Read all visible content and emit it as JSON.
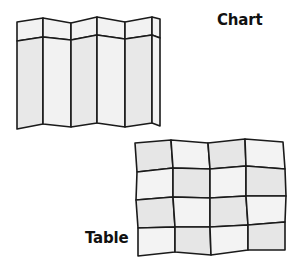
{
  "labels": {
    "chart": "Chart",
    "table": "Table"
  },
  "colors": {
    "stroke": "#1a1a1a",
    "panel_light": "#f2f2f2",
    "panel_mid": "#e8e8e8",
    "background": "#ffffff"
  },
  "folded_chart": {
    "panels": 6,
    "fold_x": [
      17,
      43,
      71,
      97,
      125,
      152,
      160
    ],
    "top_y": [
      22,
      18,
      23,
      17,
      22,
      17,
      19
    ],
    "header_y": [
      41,
      37,
      40,
      35,
      39,
      35,
      38
    ],
    "bottom_y": [
      129,
      124,
      127,
      123,
      127,
      123,
      126
    ]
  },
  "distorted_table": {
    "rows": 4,
    "cols": 4,
    "vertices": [
      [
        [
          135,
          143
        ],
        [
          171,
          140
        ],
        [
          208,
          143
        ],
        [
          245,
          139
        ],
        [
          283,
          142
        ]
      ],
      [
        [
          137,
          172
        ],
        [
          173,
          168
        ],
        [
          210,
          169
        ],
        [
          246,
          166
        ],
        [
          285,
          169
        ]
      ],
      [
        [
          136,
          200
        ],
        [
          173,
          197
        ],
        [
          210,
          198
        ],
        [
          246,
          196
        ],
        [
          286,
          196
        ]
      ],
      [
        [
          138,
          228
        ],
        [
          175,
          227
        ],
        [
          210,
          227
        ],
        [
          248,
          225
        ],
        [
          285,
          222
        ]
      ],
      [
        [
          138,
          256
        ],
        [
          175,
          252
        ],
        [
          211,
          255
        ],
        [
          248,
          250
        ],
        [
          285,
          250
        ]
      ]
    ]
  }
}
